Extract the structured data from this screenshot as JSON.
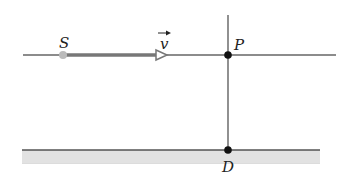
{
  "diagram": {
    "labels": {
      "source": "S",
      "velocity": "v",
      "point_p": "P",
      "point_d": "D"
    },
    "colors": {
      "line": "#555555",
      "arrow": "#777777",
      "ground_fill": "#d9d9d9",
      "source_dot": "#bbbbbb",
      "point_dot": "#111111"
    },
    "elements": [
      "horizontal path line through S and P",
      "velocity arrow from S pointing right",
      "vertical line through P to D",
      "ground surface with hatched band",
      "point P at intersection",
      "point D on ground"
    ]
  }
}
